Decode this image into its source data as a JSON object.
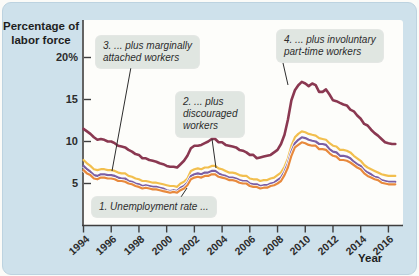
{
  "figure": {
    "kind": "textbook line chart of alternative U.S. unemployment measures, 1994-2016"
  },
  "colors": {
    "card_background": "#cee1eb",
    "plot_background": "#fdfdfa",
    "axis": "#3e3e3e",
    "callout_background": "#e0e6e1",
    "text": "#2d2d2d",
    "series_u6_maroon": "#8a3851",
    "series_u5_yellow": "#f2bf4e",
    "series_u4_purple": "#7b5fa4",
    "series_u3_orange": "#e8893c"
  },
  "axis": {
    "y_label_line1": "Percentage of",
    "y_label_line2": "labor force",
    "y_tick_labels": [
      "20%",
      "15",
      "10",
      "5"
    ],
    "y_tick_values": [
      20,
      15,
      10,
      5
    ],
    "x_tick_labels": [
      "1994",
      "1996",
      "1998",
      "2000",
      "2002",
      "2004",
      "2006",
      "2008",
      "2010",
      "2012",
      "2014",
      "2016"
    ],
    "x_tick_values": [
      1994,
      1996,
      1998,
      2000,
      2002,
      2004,
      2006,
      2008,
      2010,
      2012,
      2014,
      2016
    ],
    "x_label": "Year"
  },
  "callouts": {
    "c1": {
      "line1": "1. Unemployment rate ..."
    },
    "c2": {
      "line1": "2. ... plus",
      "line2": "discouraged",
      "line3": "workers"
    },
    "c3": {
      "line1": "3. ... plus marginally",
      "line2": "attached workers"
    },
    "c4": {
      "line1": "4. ... plus involuntary",
      "line2": "part-time workers"
    }
  },
  "chart_data": {
    "type": "line",
    "title": "",
    "xlabel": "Year",
    "ylabel": "Percentage of labor force",
    "xlim": [
      1994,
      2016.75
    ],
    "ylim": [
      0,
      22
    ],
    "grid": false,
    "legend_position": "inline-callouts",
    "x_unit": "year (quarterly points)",
    "x": [
      1994.0,
      1994.25,
      1994.5,
      1994.75,
      1995.0,
      1995.25,
      1995.5,
      1995.75,
      1996.0,
      1996.25,
      1996.5,
      1996.75,
      1997.0,
      1997.25,
      1997.5,
      1997.75,
      1998.0,
      1998.25,
      1998.5,
      1998.75,
      1999.0,
      1999.25,
      1999.5,
      1999.75,
      2000.0,
      2000.25,
      2000.5,
      2000.75,
      2001.0,
      2001.25,
      2001.5,
      2001.75,
      2002.0,
      2002.25,
      2002.5,
      2002.75,
      2003.0,
      2003.25,
      2003.5,
      2003.75,
      2004.0,
      2004.25,
      2004.5,
      2004.75,
      2005.0,
      2005.25,
      2005.5,
      2005.75,
      2006.0,
      2006.25,
      2006.5,
      2006.75,
      2007.0,
      2007.25,
      2007.5,
      2007.75,
      2008.0,
      2008.25,
      2008.5,
      2008.75,
      2009.0,
      2009.25,
      2009.5,
      2009.75,
      2010.0,
      2010.25,
      2010.5,
      2010.75,
      2011.0,
      2011.25,
      2011.5,
      2011.75,
      2012.0,
      2012.25,
      2012.5,
      2012.75,
      2013.0,
      2013.25,
      2013.5,
      2013.75,
      2014.0,
      2014.25,
      2014.5,
      2014.75,
      2015.0,
      2015.25,
      2015.5,
      2015.75,
      2016.0,
      2016.25,
      2016.5
    ],
    "series": [
      {
        "name": "4. ... plus involuntary part-time workers (U-6)",
        "color": "#8a3851",
        "values": [
          11.5,
          11.2,
          10.9,
          10.5,
          10.2,
          10.3,
          10.2,
          10.0,
          10.0,
          9.8,
          9.5,
          9.4,
          9.3,
          9.0,
          8.8,
          8.5,
          8.4,
          8.0,
          8.0,
          7.8,
          7.7,
          7.6,
          7.4,
          7.3,
          7.1,
          7.0,
          7.0,
          6.9,
          7.3,
          7.7,
          8.3,
          9.2,
          9.5,
          9.5,
          9.6,
          9.8,
          10.0,
          10.3,
          10.3,
          9.9,
          9.9,
          9.6,
          9.5,
          9.4,
          9.3,
          9.0,
          8.9,
          8.7,
          8.4,
          8.4,
          8.0,
          8.1,
          8.2,
          8.3,
          8.4,
          8.7,
          9.0,
          9.7,
          10.8,
          12.6,
          14.9,
          16.1,
          16.7,
          17.1,
          16.9,
          16.6,
          16.9,
          16.7,
          15.9,
          15.9,
          16.2,
          15.6,
          14.9,
          14.8,
          14.6,
          14.4,
          14.3,
          13.8,
          13.6,
          13.1,
          12.7,
          12.1,
          11.9,
          11.4,
          11.0,
          10.7,
          10.3,
          9.9,
          9.8,
          9.7,
          9.7
        ]
      },
      {
        "name": "3. ... plus marginally attached workers (U-5)",
        "color": "#f2bf4e",
        "values": [
          7.8,
          7.4,
          7.1,
          6.7,
          6.6,
          6.7,
          6.7,
          6.6,
          6.6,
          6.5,
          6.3,
          6.2,
          6.2,
          5.9,
          5.8,
          5.6,
          5.5,
          5.3,
          5.3,
          5.2,
          5.1,
          5.1,
          5.0,
          4.9,
          4.8,
          4.7,
          4.7,
          4.6,
          5.0,
          5.2,
          5.6,
          6.5,
          6.7,
          6.8,
          6.7,
          6.9,
          6.9,
          7.1,
          7.1,
          6.8,
          6.7,
          6.5,
          6.3,
          6.3,
          6.2,
          6.0,
          5.9,
          5.9,
          5.6,
          5.5,
          5.5,
          5.3,
          5.4,
          5.4,
          5.6,
          5.7,
          6.0,
          6.3,
          7.0,
          8.0,
          9.5,
          10.5,
          10.9,
          11.2,
          11.1,
          10.9,
          10.8,
          10.7,
          10.4,
          10.3,
          10.2,
          9.8,
          9.5,
          9.4,
          9.0,
          9.0,
          8.9,
          8.7,
          8.3,
          8.0,
          7.7,
          7.2,
          6.9,
          6.7,
          6.5,
          6.3,
          6.1,
          6.0,
          5.9,
          5.9,
          5.9
        ]
      },
      {
        "name": "2. ... plus discouraged workers (U-4)",
        "color": "#7b5fa4",
        "values": [
          7.1,
          6.7,
          6.4,
          6.0,
          5.9,
          6.1,
          6.1,
          6.0,
          6.0,
          5.9,
          5.7,
          5.6,
          5.6,
          5.3,
          5.2,
          5.0,
          4.9,
          4.7,
          4.8,
          4.7,
          4.6,
          4.6,
          4.5,
          4.4,
          4.2,
          4.1,
          4.2,
          4.1,
          4.5,
          4.7,
          5.1,
          5.9,
          6.1,
          6.2,
          6.1,
          6.3,
          6.3,
          6.5,
          6.5,
          6.2,
          6.0,
          5.9,
          5.7,
          5.7,
          5.6,
          5.4,
          5.3,
          5.3,
          5.0,
          4.9,
          4.9,
          4.7,
          4.8,
          4.8,
          5.0,
          5.1,
          5.4,
          5.7,
          6.4,
          7.4,
          8.8,
          9.8,
          10.2,
          10.5,
          10.4,
          10.2,
          10.1,
          10.0,
          9.7,
          9.7,
          9.6,
          9.1,
          8.8,
          8.7,
          8.3,
          8.3,
          8.2,
          8.0,
          7.6,
          7.3,
          7.1,
          6.6,
          6.3,
          6.1,
          5.8,
          5.7,
          5.4,
          5.3,
          5.2,
          5.2,
          5.2
        ]
      },
      {
        "name": "1. Unemployment rate (U-3)",
        "color": "#e8893c",
        "values": [
          6.6,
          6.2,
          6.0,
          5.6,
          5.5,
          5.7,
          5.7,
          5.6,
          5.6,
          5.5,
          5.3,
          5.3,
          5.2,
          5.0,
          4.9,
          4.7,
          4.6,
          4.4,
          4.5,
          4.4,
          4.3,
          4.3,
          4.2,
          4.1,
          4.0,
          3.9,
          4.0,
          3.9,
          4.2,
          4.4,
          4.8,
          5.5,
          5.7,
          5.8,
          5.7,
          5.9,
          5.9,
          6.1,
          6.1,
          5.8,
          5.7,
          5.6,
          5.4,
          5.4,
          5.3,
          5.1,
          5.0,
          5.0,
          4.7,
          4.6,
          4.6,
          4.4,
          4.5,
          4.5,
          4.7,
          4.8,
          5.0,
          5.3,
          6.0,
          6.9,
          8.3,
          9.3,
          9.6,
          9.9,
          9.8,
          9.6,
          9.5,
          9.5,
          9.1,
          9.1,
          9.0,
          8.6,
          8.3,
          8.2,
          7.8,
          7.8,
          7.7,
          7.5,
          7.2,
          6.9,
          6.7,
          6.2,
          5.9,
          5.7,
          5.5,
          5.4,
          5.1,
          5.0,
          4.9,
          4.9,
          4.9
        ]
      }
    ]
  }
}
